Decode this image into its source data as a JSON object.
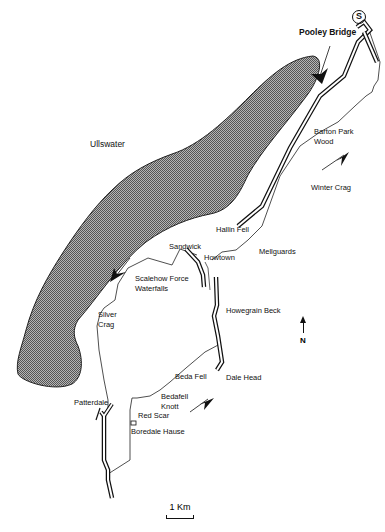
{
  "map": {
    "title": "Ullswater walking route",
    "lake": {
      "name": "Ullswater",
      "fill_pattern": "stippled-grey"
    },
    "start_marker": {
      "symbol": "S",
      "label": "Pooley Bridge"
    },
    "places": [
      {
        "id": "pooley-bridge",
        "label": "Pooley Bridge"
      },
      {
        "id": "barton-park-wood-1",
        "label": "Barton Park"
      },
      {
        "id": "barton-park-wood-2",
        "label": "Wood"
      },
      {
        "id": "winter-crag",
        "label": "Winter Crag"
      },
      {
        "id": "hallin-fell",
        "label": "Hallin Fell"
      },
      {
        "id": "sandwick",
        "label": "Sandwick"
      },
      {
        "id": "howtown",
        "label": "Howtown"
      },
      {
        "id": "mellguards",
        "label": "Mellguards"
      },
      {
        "id": "scalehow-force-1",
        "label": "Scalehow Force"
      },
      {
        "id": "scalehow-force-2",
        "label": "Waterfalls"
      },
      {
        "id": "silver-crag-1",
        "label": "Silver"
      },
      {
        "id": "silver-crag-2",
        "label": "Crag"
      },
      {
        "id": "howegrain-beck",
        "label": "Howegrain Beck"
      },
      {
        "id": "beda-fell",
        "label": "Beda Fell"
      },
      {
        "id": "dale-head",
        "label": "Dale Head"
      },
      {
        "id": "bedafell-knott-1",
        "label": "Bedafell"
      },
      {
        "id": "bedafell-knott-2",
        "label": "Knott"
      },
      {
        "id": "patterdale",
        "label": "Patterdale"
      },
      {
        "id": "red-scar",
        "label": "Red Scar"
      },
      {
        "id": "boredale-hause",
        "label": "Boredale Hause"
      }
    ],
    "north_indicator": {
      "label": "N"
    },
    "scale": {
      "label": "1 Km"
    },
    "colors": {
      "ink": "#111111",
      "lake": "#8a8a8a",
      "paper": "#ffffff"
    }
  }
}
